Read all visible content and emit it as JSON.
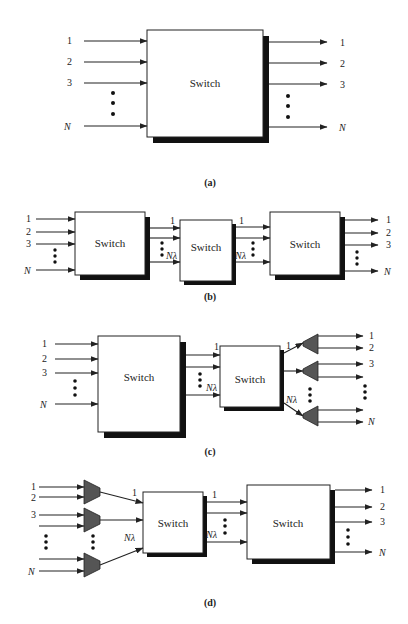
{
  "figure": {
    "panels": [
      {
        "id": "a",
        "caption": "(a)",
        "switches": [
          {
            "label": "Switch"
          }
        ],
        "input_labels": [
          "1",
          "2",
          "3",
          "N"
        ],
        "output_labels": [
          "1",
          "2",
          "3",
          "N"
        ]
      },
      {
        "id": "b",
        "caption": "(b)",
        "switches": [
          {
            "label": "Switch"
          },
          {
            "label": "Switch"
          },
          {
            "label": "Switch"
          }
        ],
        "input_labels": [
          "1",
          "2",
          "3",
          "N"
        ],
        "link1_labels": [
          "1",
          "Nλ"
        ],
        "link2_labels": [
          "1",
          "Nλ"
        ],
        "output_labels": [
          "1",
          "2",
          "3",
          "N"
        ]
      },
      {
        "id": "c",
        "caption": "(c)",
        "switches": [
          {
            "label": "Switch"
          },
          {
            "label": "Switch"
          }
        ],
        "input_labels": [
          "1",
          "2",
          "3",
          "N"
        ],
        "link1_labels": [
          "1",
          "Nλ"
        ],
        "demux_labels": [
          "1",
          "Nλ"
        ],
        "output_labels": [
          "1",
          "2",
          "3",
          "N"
        ]
      },
      {
        "id": "d",
        "caption": "(d)",
        "switches": [
          {
            "label": "Switch"
          },
          {
            "label": "Switch"
          }
        ],
        "input_labels": [
          "1",
          "2",
          "3",
          "N"
        ],
        "mux_labels": [
          "1",
          "Nλ"
        ],
        "link1_labels": [
          "1",
          "Nλ"
        ],
        "output_labels": [
          "1",
          "2",
          "3",
          "N"
        ]
      }
    ]
  }
}
